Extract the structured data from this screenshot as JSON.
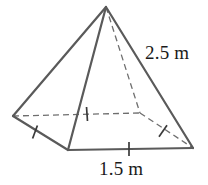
{
  "figure": {
    "name": "square-pyramid-diagram",
    "stroke_color": "#5a5a5a",
    "hidden_stroke_color": "#6e6e6e",
    "tick_color": "#3a3a3a",
    "text_color": "#1a1a1a",
    "background": "#ffffff",
    "stroke_width": 2.2,
    "hidden_stroke_width": 1.3,
    "dash_pattern": "6 4"
  },
  "vertices": {
    "apex": {
      "name": "apex",
      "x": 106,
      "y": 7
    },
    "base_left": {
      "name": "base-left-vertex",
      "x": 13,
      "y": 116
    },
    "base_front": {
      "name": "base-front-vertex",
      "x": 68,
      "y": 150
    },
    "base_right": {
      "name": "base-right-vertex",
      "x": 193,
      "y": 148
    },
    "base_back": {
      "name": "base-back-hidden-vertex",
      "x": 140,
      "y": 113
    }
  },
  "edges": {
    "solid": [
      {
        "name": "lateral-edge-apex-left",
        "from": "apex",
        "to": "base_left"
      },
      {
        "name": "lateral-edge-apex-front",
        "from": "apex",
        "to": "base_front"
      },
      {
        "name": "lateral-edge-apex-right",
        "from": "apex",
        "to": "base_right"
      },
      {
        "name": "base-edge-left-front",
        "from": "base_left",
        "to": "base_front"
      },
      {
        "name": "base-edge-front-right",
        "from": "base_front",
        "to": "base_right"
      }
    ],
    "hidden": [
      {
        "name": "lateral-edge-apex-back",
        "from": "apex",
        "to": "base_back"
      },
      {
        "name": "base-edge-left-back",
        "from": "base_left",
        "to": "base_back"
      },
      {
        "name": "base-edge-back-right",
        "from": "base_back",
        "to": "base_right"
      }
    ]
  },
  "tick_marks": [
    {
      "name": "tick-base-edge-left-front",
      "x": 35,
      "y": 132,
      "angle": 20
    },
    {
      "name": "tick-base-edge-left-back",
      "x": 87,
      "y": 114,
      "angle": 88
    },
    {
      "name": "tick-base-edge-back-right",
      "x": 163,
      "y": 131,
      "angle": 55
    },
    {
      "name": "tick-base-edge-front-right",
      "x": 129,
      "y": 149,
      "angle": 90
    }
  ],
  "labels": {
    "slant_height": {
      "name": "slant-height-label",
      "text": "2.5 m",
      "value": 2.5,
      "unit": "m"
    },
    "base_edge": {
      "name": "base-edge-label",
      "text": "1.5 m",
      "value": 1.5,
      "unit": "m"
    }
  }
}
